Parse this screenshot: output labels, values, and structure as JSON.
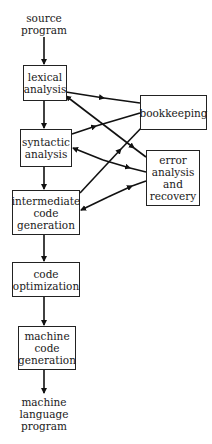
{
  "diagram": {
    "type": "compiler phases flow diagram",
    "input_label": "source\nprogram",
    "output_label": "machine\nlanguage\nprogram",
    "nodes": [
      {
        "id": "lexical",
        "label": "lexical\nanalysis"
      },
      {
        "id": "syntactic",
        "label": "syntactic\nanalysis"
      },
      {
        "id": "intermediate",
        "label": "intermediate\ncode\ngeneration"
      },
      {
        "id": "optimization",
        "label": "code\noptimization"
      },
      {
        "id": "machinecode",
        "label": "machine\ncode\ngeneration"
      },
      {
        "id": "bookkeeping",
        "label": "bookkeeping"
      },
      {
        "id": "error",
        "label": "error\nanalysis\nand\nrecovery"
      }
    ],
    "edges": [
      {
        "from": "source",
        "to": "lexical"
      },
      {
        "from": "lexical",
        "to": "syntactic"
      },
      {
        "from": "syntactic",
        "to": "intermediate"
      },
      {
        "from": "intermediate",
        "to": "optimization"
      },
      {
        "from": "optimization",
        "to": "machinecode"
      },
      {
        "from": "machinecode",
        "to": "output"
      },
      {
        "from": "lexical",
        "to": "bookkeeping",
        "bidirectional": false
      },
      {
        "from": "syntactic",
        "to": "bookkeeping",
        "bidirectional": false
      },
      {
        "from": "intermediate",
        "to": "bookkeeping",
        "bidirectional": false
      },
      {
        "from": "lexical",
        "to": "error",
        "bidirectional": true
      },
      {
        "from": "syntactic",
        "to": "error",
        "bidirectional": true
      },
      {
        "from": "intermediate",
        "to": "error",
        "bidirectional": true
      }
    ]
  }
}
